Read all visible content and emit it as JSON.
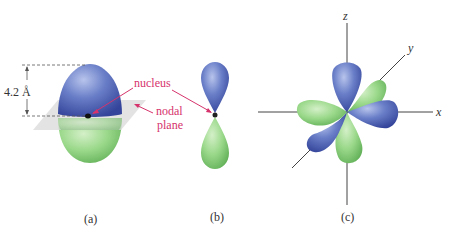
{
  "figure": {
    "panels": [
      {
        "id": "a",
        "caption": "(a)"
      },
      {
        "id": "b",
        "caption": "(b)"
      },
      {
        "id": "c",
        "caption": "(c)"
      }
    ],
    "annotations": {
      "distance": "4.2 Å",
      "nucleus": "nucleus",
      "nodal_line1": "nodal",
      "nodal_line2": "plane"
    },
    "axes": {
      "x": "x",
      "y": "y",
      "z": "z"
    },
    "colors": {
      "positive_lobe": "#5a6fb8",
      "negative_lobe": "#8fcf80",
      "annotation": "#d6336c",
      "axis": "#444444",
      "plane": "#d9d9d9"
    }
  }
}
